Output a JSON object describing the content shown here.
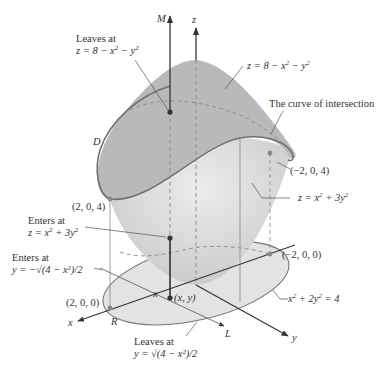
{
  "figure": {
    "type": "3d-region-diagram",
    "surfaces": {
      "upper": "z = 8 − x² − y²",
      "lower": "z = x² + 3y²",
      "intersection_label": "The curve of intersection"
    },
    "colors": {
      "upper_surface": "#b9b9b9",
      "lower_surface": "#d6d6d6",
      "ellipse_fill": "#e2e2e2",
      "curve": "#6f6f6f",
      "axis": "#333333",
      "text": "#333333"
    }
  },
  "axes": {
    "z": "z",
    "x": "x",
    "y": "y",
    "M": "M",
    "L": "L"
  },
  "labels": {
    "leaves_top_line1": "Leaves at",
    "leaves_top_line2_pre": "z = 8 − x",
    "leaves_top_line2_mid": " − y",
    "upper_surface_pre": "z = 8 − x",
    "upper_surface_mid": " − y",
    "curve_of_intersection": "The curve of intersection",
    "D": "D",
    "pt_m2_0_4": "(−2, 0, 4)",
    "pt_2_0_4": "(2, 0, 4)",
    "lower_surface_pre": "z = x",
    "lower_surface_mid": " + 3y",
    "enters_z_line1": "Enters at",
    "enters_z_line2_pre": "z = x",
    "enters_z_line2_mid": " + 3y",
    "enters_y_line1": "Enters at",
    "enters_y_line2": "y = −√(4 − x²)/2",
    "pt_m2_0_0": "(−2, 0, 0)",
    "pt_2_0_0": "(2, 0, 0)",
    "x_mark": "x",
    "xy_point": "(x, y)",
    "ellipse_pre": "x",
    "ellipse_mid": " + 2y",
    "ellipse_post": " = 4",
    "R": "R",
    "leaves_y_line1": "Leaves at",
    "leaves_y_line2": "y = √(4 − x²)/2",
    "exp2": "2"
  }
}
